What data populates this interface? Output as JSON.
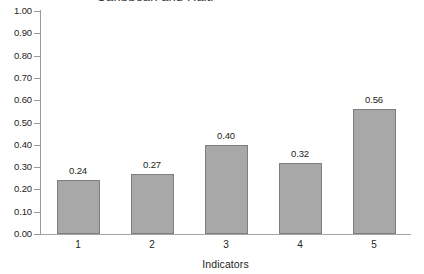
{
  "chart_data": {
    "type": "bar",
    "title": "Caribbean and Haiti",
    "xlabel": "Indicators",
    "ylabel": "",
    "categories": [
      "1",
      "2",
      "3",
      "4",
      "5"
    ],
    "values": [
      0.24,
      0.27,
      0.4,
      0.32,
      0.56
    ],
    "value_labels": [
      "0.24",
      "0.27",
      "0.40",
      "0.32",
      "0.56"
    ],
    "ylim": [
      0.0,
      1.0
    ],
    "ytick_step": 0.1,
    "ytick_labels": [
      "1.00",
      "0.90",
      "0.80",
      "0.70",
      "0.60",
      "0.50",
      "0.40",
      "0.30",
      "0.20",
      "0.10",
      "0.00"
    ],
    "grid": false,
    "legend": "none",
    "bar_fill_color": "#a8a8a8",
    "bar_border_color": "#7d7d7d",
    "axis_color": "#9b9b9b",
    "text_color": "#231f20",
    "background_color": "#ffffff"
  }
}
